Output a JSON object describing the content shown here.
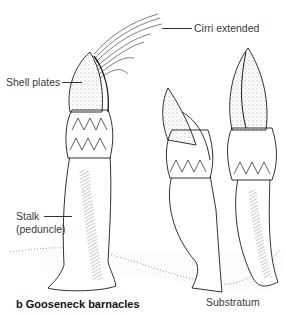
{
  "figure": {
    "caption": "b Gooseneck barnacles",
    "labels": {
      "cirri": "Cirri extended",
      "shell_plates": "Shell plates",
      "stalk_line1": "Stalk",
      "stalk_line2": "(peduncle)",
      "substratum": "Substratum"
    },
    "colors": {
      "ink": "#1a1a1a",
      "label_text": "#3a3a3a",
      "background": "#ffffff"
    }
  }
}
